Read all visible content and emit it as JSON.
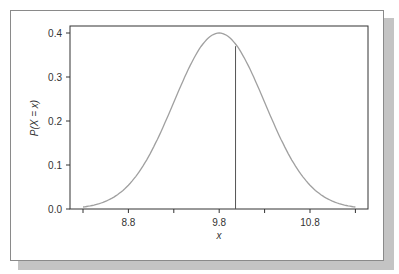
{
  "chart_data": {
    "type": "line",
    "title": "",
    "xlabel": "x",
    "ylabel": "P(X = x)",
    "xlim": [
      8.22,
      11.45
    ],
    "ylim": [
      0.0,
      0.415
    ],
    "x_ticks": [
      8.3,
      8.8,
      9.3,
      9.8,
      10.3,
      10.8,
      11.3
    ],
    "x_tick_labels": [
      "",
      "8.8",
      "",
      "9.8",
      "",
      "10.8",
      ""
    ],
    "y_ticks": [
      0.0,
      0.1,
      0.2,
      0.3,
      0.4
    ],
    "y_tick_labels": [
      "0.0",
      "0.1",
      "0.2",
      "0.3",
      "0.4"
    ],
    "grid": false,
    "legend": null,
    "series": [
      {
        "name": "density curve",
        "distribution": "normal",
        "mean": 9.8,
        "peak": 0.4,
        "sd_approx": 0.5,
        "x": [
          8.3,
          8.5,
          8.7,
          8.9,
          9.1,
          9.3,
          9.5,
          9.7,
          9.8,
          9.9,
          10.1,
          10.3,
          10.5,
          10.7,
          10.9,
          11.1,
          11.3
        ],
        "values": [
          0.004,
          0.015,
          0.036,
          0.078,
          0.15,
          0.243,
          0.334,
          0.392,
          0.4,
          0.392,
          0.334,
          0.243,
          0.15,
          0.078,
          0.036,
          0.015,
          0.004
        ]
      }
    ],
    "annotations": [
      {
        "type": "vertical-line",
        "x": 9.98,
        "y_top": 0.37
      }
    ]
  },
  "colors": {
    "curve": "#a0a0a0",
    "axis": "#333333",
    "vline": "#555555",
    "frame": "#8a8a8a",
    "shadow": "#c4c4c4"
  }
}
